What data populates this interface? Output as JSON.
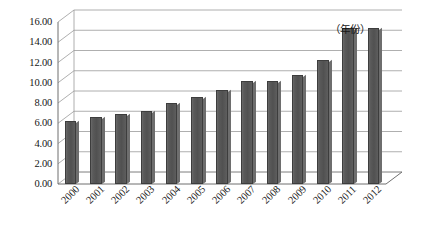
{
  "chart_data": {
    "type": "bar",
    "title": "",
    "subtitle": "",
    "xlabel": "（年份）",
    "ylabel": "",
    "categories": [
      "2000",
      "2001",
      "2002",
      "2003",
      "2004",
      "2005",
      "2006",
      "2007",
      "2008",
      "2009",
      "2010",
      "2011",
      "2012"
    ],
    "values": [
      6.2,
      6.6,
      6.9,
      7.2,
      8.0,
      8.6,
      9.3,
      10.2,
      10.2,
      10.8,
      12.2,
      15.4,
      15.4
    ],
    "ylim": [
      0,
      16
    ],
    "ytick_step": 2,
    "ytick_labels": [
      "16.00",
      "14.00",
      "12.00",
      "10.00",
      "8.00",
      "6.00",
      "4.00",
      "2.00",
      "0.00"
    ],
    "ytick_values": [
      16,
      14,
      12,
      10,
      8,
      6,
      4,
      2,
      0
    ],
    "grid": true,
    "legend": "none",
    "legend_position": "none",
    "style": "3d-column",
    "series": [
      {
        "name": "",
        "values": [
          6.2,
          6.6,
          6.9,
          7.2,
          8.0,
          8.6,
          9.3,
          10.2,
          10.2,
          10.8,
          12.2,
          15.4,
          15.4
        ]
      }
    ]
  },
  "colors": {
    "bar_fill": "#585858",
    "bar_edge": "#3d3d3d",
    "grid_line": "#9a9a9a",
    "axis_line": "#6f6f6f",
    "text": "#161616",
    "background": "#ffffff"
  }
}
